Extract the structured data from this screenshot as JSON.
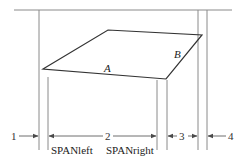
{
  "diagram": {
    "shape_labels": {
      "a": "A",
      "b": "B"
    },
    "region_labels": {
      "r1": "1",
      "r2": "2",
      "r3": "3",
      "r4": "4"
    },
    "span_labels": {
      "left": "SPANleft",
      "right": "SPANright"
    },
    "colors": {
      "line": "#4a4a4a",
      "background": "#ffffff"
    }
  }
}
